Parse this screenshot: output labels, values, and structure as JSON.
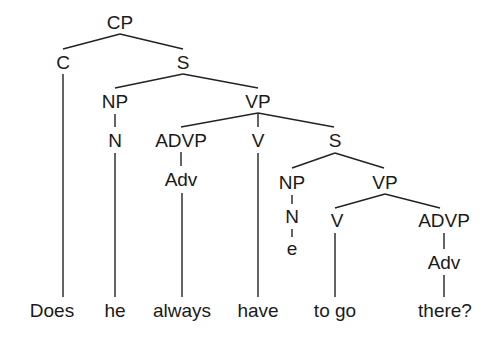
{
  "diagram": {
    "type": "syntax-tree",
    "nodes": {
      "cp": {
        "label": "CP",
        "x": 120,
        "y": 22
      },
      "c": {
        "label": "C",
        "x": 63,
        "y": 62
      },
      "s1": {
        "label": "S",
        "x": 183,
        "y": 62
      },
      "np1": {
        "label": "NP",
        "x": 115,
        "y": 101
      },
      "vp1": {
        "label": "VP",
        "x": 258,
        "y": 101
      },
      "n1": {
        "label": "N",
        "x": 115,
        "y": 140
      },
      "advp1": {
        "label": "ADVP",
        "x": 181,
        "y": 140
      },
      "v1": {
        "label": "V",
        "x": 258,
        "y": 140
      },
      "s2": {
        "label": "S",
        "x": 335,
        "y": 140
      },
      "adv1": {
        "label": "Adv",
        "x": 181,
        "y": 179
      },
      "np2": {
        "label": "NP",
        "x": 292,
        "y": 182
      },
      "vp2": {
        "label": "VP",
        "x": 385,
        "y": 182
      },
      "n2": {
        "label": "N",
        "x": 292,
        "y": 216
      },
      "v2": {
        "label": "V",
        "x": 337,
        "y": 220
      },
      "advp2": {
        "label": "ADVP",
        "x": 444,
        "y": 220
      },
      "e": {
        "label": "e",
        "x": 292,
        "y": 248
      },
      "adv2": {
        "label": "Adv",
        "x": 444,
        "y": 265
      }
    },
    "words": [
      {
        "text": "Does",
        "x": 52,
        "y": 310
      },
      {
        "text": "he",
        "x": 115,
        "y": 310
      },
      {
        "text": "always",
        "x": 182,
        "y": 310
      },
      {
        "text": "have",
        "x": 258,
        "y": 310
      },
      {
        "text": "to go",
        "x": 335,
        "y": 310
      },
      {
        "text": "there?",
        "x": 445,
        "y": 310
      }
    ]
  }
}
